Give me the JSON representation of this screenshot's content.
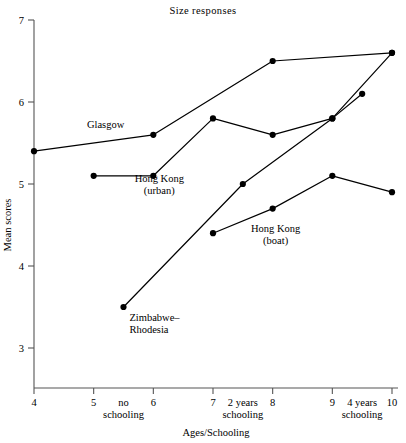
{
  "chart_data": {
    "type": "line",
    "title": "Size  responses",
    "xlabel": "Ages/Schooling",
    "ylabel": "Mean scores",
    "xlim": [
      4,
      10
    ],
    "ylim": [
      2.6,
      7
    ],
    "grid": false,
    "legend": "inline-labels",
    "x_ticks": [
      4,
      5,
      6,
      7,
      8,
      9,
      10
    ],
    "x_tick_labels": [
      "4",
      "5",
      "6",
      "7",
      "8",
      "9",
      "10"
    ],
    "y_ticks": [
      3,
      4,
      5,
      6,
      7
    ],
    "y_tick_labels": [
      "3",
      "4",
      "5",
      "6",
      "7"
    ],
    "x_secondary_annotations": [
      {
        "label_line1": "no",
        "label_line2": "schooling",
        "x": 5.5
      },
      {
        "label_line1": "2 years",
        "label_line2": "schooling",
        "x": 7.5
      },
      {
        "label_line1": "4 years",
        "label_line2": "schooling",
        "x": 9.5
      }
    ],
    "series": [
      {
        "name": "Glasgow",
        "label_line1": "Glasgow",
        "label_line2": "",
        "label_x": 5.2,
        "label_y": 5.68,
        "x": [
          4,
          6,
          8,
          10
        ],
        "y": [
          5.4,
          5.6,
          6.5,
          6.6
        ]
      },
      {
        "name": "Hong Kong (urban)",
        "label_line1": "Hong Kong",
        "label_line2": "(urban)",
        "label_x": 6.1,
        "label_y": 5.03,
        "x": [
          5,
          6,
          7,
          8,
          9,
          10
        ],
        "y": [
          5.1,
          5.1,
          5.8,
          5.6,
          5.8,
          6.6
        ]
      },
      {
        "name": "Hong Kong (boat)",
        "label_line1": "Hong Kong",
        "label_line2": "(boat)",
        "label_x": 8.05,
        "label_y": 4.42,
        "x": [
          7,
          8,
          9,
          10
        ],
        "y": [
          4.4,
          4.7,
          5.1,
          4.9
        ]
      },
      {
        "name": "Zimbabwe-Rhodesia",
        "label_line1": "Zimbabwe–",
        "label_line2": "Rhodesia",
        "label_x": 5.6,
        "label_y": 3.33,
        "x": [
          5.5,
          7.5,
          9,
          9.5
        ],
        "y": [
          3.5,
          5.0,
          5.8,
          6.1
        ]
      }
    ],
    "colors": {
      "line": "#000000",
      "marker": "#000000",
      "axis": "#444444",
      "background": "#ffffff"
    }
  }
}
